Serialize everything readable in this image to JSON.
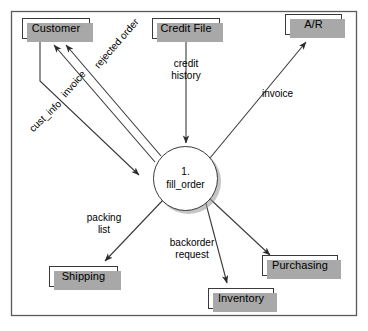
{
  "diagram": {
    "type": "data-flow-diagram",
    "frame_color": "#4a4a4a",
    "shadow_color": "#a8a8a8",
    "line_color": "#3a3a3a",
    "process": {
      "number": "1.",
      "name": "fill_order"
    },
    "entities": [
      {
        "id": "customer",
        "label": "Customer"
      },
      {
        "id": "credit_file",
        "label": "Credit File"
      },
      {
        "id": "ar",
        "label": "A/R"
      },
      {
        "id": "shipping",
        "label": "Shipping"
      },
      {
        "id": "inventory",
        "label": "Inventory"
      },
      {
        "id": "purchasing",
        "label": "Purchasing"
      }
    ],
    "flows": [
      {
        "id": "rejected_order",
        "label": "rejected order",
        "from": "fill_order",
        "to": "customer"
      },
      {
        "id": "invoice_customer",
        "label": "invoice",
        "from": "fill_order",
        "to": "customer"
      },
      {
        "id": "cust_info",
        "label": "cust_info",
        "from": "customer",
        "to": "fill_order"
      },
      {
        "id": "credit_history",
        "label_line1": "credit",
        "label_line2": "history",
        "from": "credit_file",
        "to": "fill_order"
      },
      {
        "id": "invoice_ar",
        "label": "invoice",
        "from": "fill_order",
        "to": "ar"
      },
      {
        "id": "packing_list",
        "label_line1": "packing",
        "label_line2": "list",
        "from": "fill_order",
        "to": "shipping"
      },
      {
        "id": "backorder_request",
        "label_line1": "backorder",
        "label_line2": "request",
        "from": "fill_order",
        "to": "inventory"
      },
      {
        "id": "purchase_flow",
        "label": "",
        "from": "fill_order",
        "to": "purchasing"
      }
    ]
  }
}
